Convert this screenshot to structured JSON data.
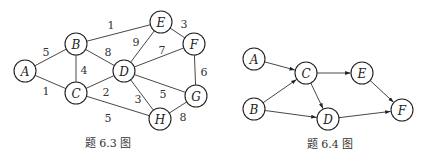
{
  "figures": [
    {
      "caption": "题 6.3 图",
      "caption_pos": [
        108,
        147
      ],
      "directed": false,
      "nodes": [
        {
          "id": "A",
          "x": 25,
          "y": 71
        },
        {
          "id": "B",
          "x": 76,
          "y": 44
        },
        {
          "id": "C",
          "x": 76,
          "y": 93
        },
        {
          "id": "D",
          "x": 124,
          "y": 71
        },
        {
          "id": "E",
          "x": 161,
          "y": 22
        },
        {
          "id": "F",
          "x": 194,
          "y": 44
        },
        {
          "id": "G",
          "x": 196,
          "y": 96
        },
        {
          "id": "H",
          "x": 160,
          "y": 119
        }
      ],
      "edges": [
        {
          "from": "A",
          "to": "B",
          "weight": "5",
          "label_pos": [
            46,
            52
          ]
        },
        {
          "from": "A",
          "to": "C",
          "weight": "1",
          "label_pos": [
            46,
            91
          ]
        },
        {
          "from": "B",
          "to": "C",
          "weight": "4",
          "label_pos": [
            84,
            70
          ]
        },
        {
          "from": "B",
          "to": "E",
          "weight": "1",
          "label_pos": [
            111,
            25
          ]
        },
        {
          "from": "B",
          "to": "D",
          "weight": "8",
          "label_pos": [
            108,
            52
          ]
        },
        {
          "from": "C",
          "to": "D",
          "weight": "2",
          "label_pos": [
            106,
            92
          ]
        },
        {
          "from": "C",
          "to": "H",
          "weight": "5",
          "label_pos": [
            108,
            118
          ]
        },
        {
          "from": "D",
          "to": "E",
          "weight": "9",
          "label_pos": [
            136,
            42
          ]
        },
        {
          "from": "D",
          "to": "F",
          "weight": "7",
          "label_pos": [
            162,
            50
          ]
        },
        {
          "from": "D",
          "to": "G",
          "weight": "5",
          "label_pos": [
            163,
            94
          ]
        },
        {
          "from": "D",
          "to": "H",
          "weight": "3",
          "label_pos": [
            138,
            99
          ]
        },
        {
          "from": "E",
          "to": "F",
          "weight": "3",
          "label_pos": [
            184,
            24
          ]
        },
        {
          "from": "F",
          "to": "G",
          "weight": "6",
          "label_pos": [
            204,
            72
          ]
        },
        {
          "from": "G",
          "to": "H",
          "weight": "8",
          "label_pos": [
            183,
            117
          ]
        }
      ]
    },
    {
      "caption": "题 6.4 图",
      "caption_pos": [
        330,
        148
      ],
      "directed": true,
      "nodes": [
        {
          "id": "A",
          "x": 254,
          "y": 59
        },
        {
          "id": "B",
          "x": 254,
          "y": 109
        },
        {
          "id": "C",
          "x": 306,
          "y": 73
        },
        {
          "id": "D",
          "x": 328,
          "y": 119
        },
        {
          "id": "E",
          "x": 362,
          "y": 73
        },
        {
          "id": "F",
          "x": 402,
          "y": 110
        }
      ],
      "edges": [
        {
          "from": "A",
          "to": "C"
        },
        {
          "from": "B",
          "to": "C"
        },
        {
          "from": "B",
          "to": "D"
        },
        {
          "from": "C",
          "to": "D"
        },
        {
          "from": "C",
          "to": "E"
        },
        {
          "from": "D",
          "to": "F"
        },
        {
          "from": "E",
          "to": "F"
        }
      ]
    }
  ],
  "style": {
    "node_radius": 11,
    "stroke_color": "#222222"
  }
}
